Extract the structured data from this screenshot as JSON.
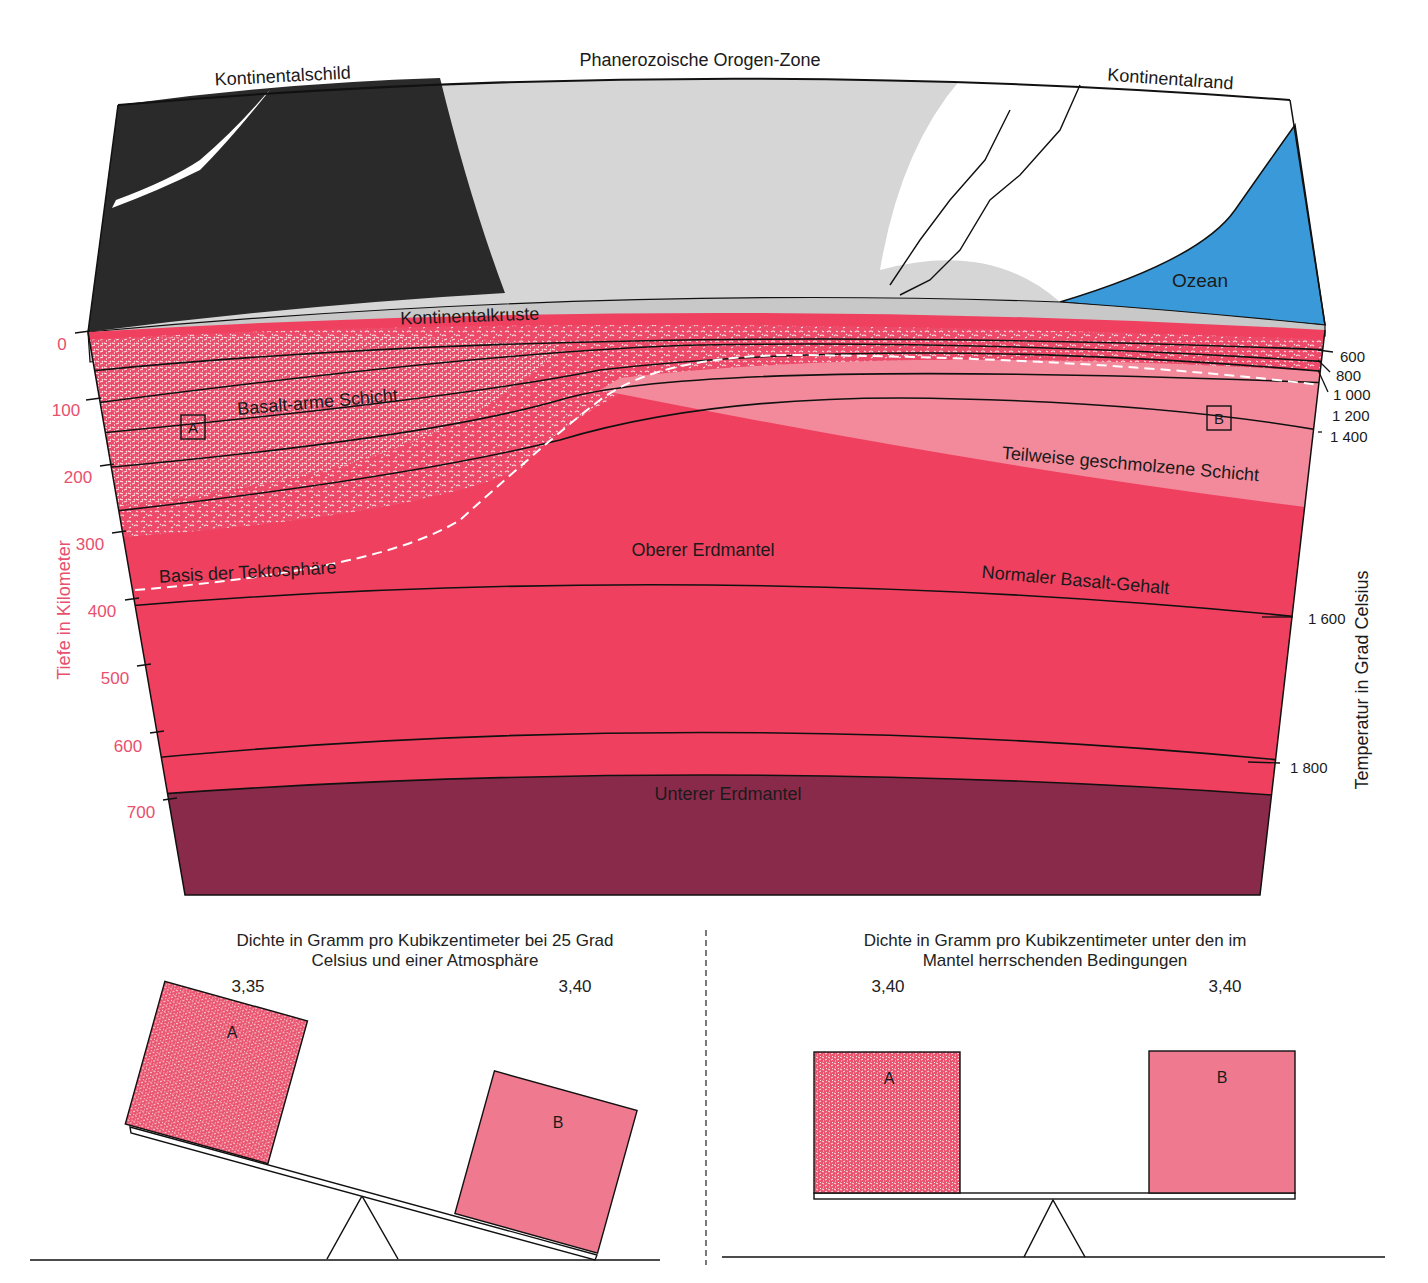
{
  "diagram": {
    "top_labels": {
      "shield": "Kontinentalschild",
      "orogen": "Phanerozoische Orogen-Zone",
      "margin": "Kontinentalrand",
      "ocean": "Ozean",
      "crust": "Kontinentalkruste"
    },
    "layer_labels": {
      "basalt_poor": "Basalt-arme Schicht",
      "partially_molten": "Teilweise geschmolzene Schicht",
      "tectosphere_base": "Basis der Tektosphäre",
      "upper_mantle": "Oberer Erdmantel",
      "normal_basalt": "Normaler Basalt-Gehalt",
      "lower_mantle": "Unterer Erdmantel"
    },
    "markers": {
      "a": "A",
      "b": "B"
    },
    "depth_axis": {
      "title": "Tiefe in Kilometer",
      "ticks": [
        "0",
        "100",
        "200",
        "300",
        "400",
        "500",
        "600",
        "700"
      ]
    },
    "temperature_axis": {
      "title": "Temperatur in Grad Celsius",
      "ticks": [
        "600",
        "800",
        "1 000",
        "1 200",
        "1 400",
        "1 600",
        "1 800"
      ]
    },
    "colors": {
      "shield": "#2a2a2a",
      "orogen": "#d6d6d6",
      "ocean": "#3a9ad9",
      "crust": "#c8c8c8",
      "upper_mantle": "#f0405f",
      "partially_molten": "#f28a9c",
      "lower_mantle": "#8a2a4a",
      "axis_pink": "#e8506e"
    }
  },
  "balance_left": {
    "caption_line1": "Dichte in Gramm pro Kubikzentimeter bei 25 Grad",
    "caption_line2": "Celsius und einer Atmosphäre",
    "value_a": "3,35",
    "value_b": "3,40",
    "block_a": "A",
    "block_b": "B"
  },
  "balance_right": {
    "caption_line1": "Dichte in Gramm pro Kubikzentimeter unter den im",
    "caption_line2": "Mantel herrschenden Bedingungen",
    "value_a": "3,40",
    "value_b": "3,40",
    "block_a": "A",
    "block_b": "B"
  }
}
